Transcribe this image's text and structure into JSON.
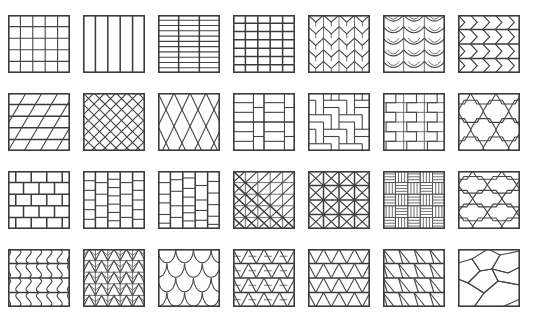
{
  "figure": {
    "caption": "",
    "grid": {
      "columns": 7,
      "rows": 4,
      "total_tiles": 28
    },
    "colors": {
      "background": "#ffffff",
      "frame_stroke": "#3c3c3c",
      "line_stroke": "#454545",
      "thin_stroke": "#555555",
      "caption_text": "#cfcfcf"
    },
    "layout": {
      "tile_width": 62,
      "tile_height": 58,
      "column_pitch": 75,
      "row_pitch": 78,
      "origin_x": 8,
      "origin_y": 15
    }
  },
  "tiles": [
    {
      "index": 1,
      "row": 1,
      "col": 1,
      "name": "square-grid-5x5",
      "label": "Stack bond square grid"
    },
    {
      "index": 2,
      "row": 1,
      "col": 2,
      "name": "vertical-stripes",
      "label": "Vertical plank stripes"
    },
    {
      "index": 3,
      "row": 1,
      "col": 3,
      "name": "horizontal-bands-3col",
      "label": "Narrow horizontal bands, three columns"
    },
    {
      "index": 4,
      "row": 1,
      "col": 4,
      "name": "rectangular-grid-5x7",
      "label": "Rectangular stack grid"
    },
    {
      "index": 5,
      "row": 1,
      "col": 5,
      "name": "chevron-down-arrows",
      "label": "Downward chevron arrows"
    },
    {
      "index": 6,
      "row": 1,
      "col": 6,
      "name": "curved-fan-scallop",
      "label": "Curved hanging fan scallops"
    },
    {
      "index": 7,
      "row": 1,
      "col": 7,
      "name": "horizontal-zigzag-chevron",
      "label": "Horizontal zigzag chevrons"
    },
    {
      "index": 8,
      "row": 2,
      "col": 1,
      "name": "diagonal-parallelogram",
      "label": "Diagonal parallelogram bond"
    },
    {
      "index": 9,
      "row": 2,
      "col": 2,
      "name": "diagonal-lattice-diamond",
      "label": "Diagonal crossed lattice"
    },
    {
      "index": 10,
      "row": 2,
      "col": 3,
      "name": "elongated-diamond-harlequin",
      "label": "Elongated harlequin diamonds"
    },
    {
      "index": 11,
      "row": 2,
      "col": 4,
      "name": "basketweave-pinwheel",
      "label": "Basket weave pinwheel"
    },
    {
      "index": 12,
      "row": 2,
      "col": 5,
      "name": "herringbone-blocks",
      "label": "Herringbone block weave"
    },
    {
      "index": 13,
      "row": 2,
      "col": 6,
      "name": "step-zigzag-blocks",
      "label": "Stepped zigzag blocks"
    },
    {
      "index": 14,
      "row": 2,
      "col": 7,
      "name": "hexagon-honeycomb",
      "label": "Hexagonal honeycomb"
    },
    {
      "index": 15,
      "row": 3,
      "col": 1,
      "name": "running-bond-brick",
      "label": "Running bond brickwork"
    },
    {
      "index": 16,
      "row": 3,
      "col": 2,
      "name": "vertical-stack-offset-brick",
      "label": "Vertical offset brick columns"
    },
    {
      "index": 17,
      "row": 3,
      "col": 3,
      "name": "vertical-random-brick",
      "label": "Vertical random course brick"
    },
    {
      "index": 18,
      "row": 3,
      "col": 4,
      "name": "diagonal-half-square",
      "label": "Diagonal half-square triangles"
    },
    {
      "index": 19,
      "row": 3,
      "col": 5,
      "name": "quartered-square-triangles",
      "label": "Quartered square triangles"
    },
    {
      "index": 20,
      "row": 3,
      "col": 6,
      "name": "woven-parquet-weave",
      "label": "Woven parquet strips"
    },
    {
      "index": 21,
      "row": 3,
      "col": 7,
      "name": "elongated-hexagon",
      "label": "Elongated stretched hexagons"
    },
    {
      "index": 22,
      "row": 4,
      "col": 1,
      "name": "wavy-vertical-ribbon",
      "label": "Wavy vertical ribbons"
    },
    {
      "index": 23,
      "row": 4,
      "col": 2,
      "name": "small-chevron-zigzag",
      "label": "Small chevron zigzag rows"
    },
    {
      "index": 24,
      "row": 4,
      "col": 3,
      "name": "fish-scale-scallop",
      "label": "Fish scale scallops"
    },
    {
      "index": 25,
      "row": 4,
      "col": 4,
      "name": "triangle-star-lattice",
      "label": "Triangle and star lattice"
    },
    {
      "index": 26,
      "row": 4,
      "col": 5,
      "name": "equilateral-triangle-grid",
      "label": "Equilateral triangle grid"
    },
    {
      "index": 27,
      "row": 4,
      "col": 6,
      "name": "skewed-triangle-grid",
      "label": "Skewed triangle grid"
    },
    {
      "index": 28,
      "row": 4,
      "col": 7,
      "name": "irregular-hexagon-paving",
      "label": "Irregular hexagon paving"
    }
  ]
}
